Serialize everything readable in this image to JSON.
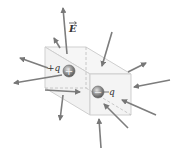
{
  "diagram": {
    "field_label": "E",
    "positive_charge_label": "+q",
    "negative_charge_label": "−q",
    "positive_sign": "+",
    "negative_sign": "−"
  },
  "colors": {
    "arrow": "#7d7d7d",
    "box_edge": "#c8c8c8",
    "box_face": "#f4f4f4",
    "charge": "#8a8a8a"
  }
}
